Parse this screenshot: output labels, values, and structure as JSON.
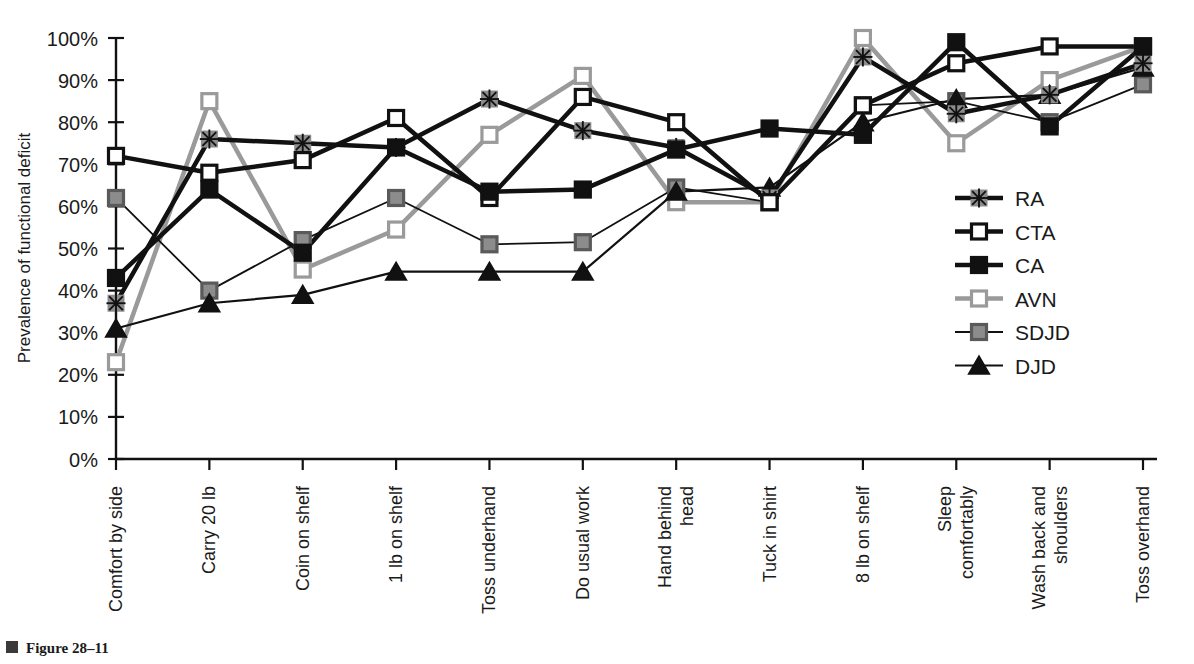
{
  "figure": {
    "caption_label": "Figure 28–11",
    "caption_marker_color": "#3a3a3a"
  },
  "chart_data": {
    "type": "line",
    "title": "",
    "xlabel": "",
    "ylabel": "Prevalence of functional deficit",
    "ylim": [
      0,
      100
    ],
    "ytick_labels": [
      "0%",
      "10%",
      "20%",
      "30%",
      "40%",
      "50%",
      "60%",
      "70%",
      "80%",
      "90%",
      "100%"
    ],
    "ytick_values": [
      0,
      10,
      20,
      30,
      40,
      50,
      60,
      70,
      80,
      90,
      100
    ],
    "grid": false,
    "legend_position": "right-middle",
    "categories": [
      "Comfort by side",
      "Carry 20 lb",
      "Coin on shelf",
      "1 lb on shelf",
      "Toss underhand",
      "Do usual work",
      "Hand behind head",
      "Tuck in shirt",
      "8 lb on shelf",
      "Sleep comfortably",
      "Wash back and shoulders",
      "Toss overhand"
    ],
    "series": [
      {
        "name": "RA",
        "marker": "asterisk",
        "marker_fill": "#8c8c8c",
        "line_color": "#111111",
        "line_width": 4.5,
        "values": [
          37,
          76,
          75,
          74,
          85.5,
          78,
          74,
          62,
          95.5,
          82,
          86.5,
          94
        ]
      },
      {
        "name": "CTA",
        "marker": "square",
        "marker_fill": "#ffffff",
        "marker_stroke": "#111111",
        "line_color": "#111111",
        "line_width": 4.5,
        "values": [
          72,
          68,
          71,
          81,
          62,
          86,
          80,
          61,
          84,
          94,
          98,
          98
        ]
      },
      {
        "name": "CA",
        "marker": "square",
        "marker_fill": "#111111",
        "marker_stroke": "#111111",
        "line_color": "#111111",
        "line_width": 4.5,
        "values": [
          43,
          64,
          49,
          74,
          63.5,
          64,
          73.5,
          78.5,
          77,
          99,
          79,
          98
        ]
      },
      {
        "name": "AVN",
        "marker": "square",
        "marker_fill": "#ffffff",
        "marker_stroke": "#9a9a9a",
        "line_color": "#9a9a9a",
        "line_width": 4.5,
        "values": [
          23,
          85,
          45,
          54.5,
          77,
          91,
          61,
          61,
          100,
          75,
          90,
          98
        ]
      },
      {
        "name": "SDJD",
        "marker": "square",
        "marker_fill": "#8c8c8c",
        "marker_stroke": "#5a5a5a",
        "line_color": "#111111",
        "line_width": 1.8,
        "values": [
          62,
          40,
          52,
          62,
          51,
          51.5,
          64.5,
          61,
          84,
          85,
          80,
          89
        ]
      },
      {
        "name": "DJD",
        "marker": "triangle",
        "marker_fill": "#111111",
        "marker_stroke": "#111111",
        "line_color": "#111111",
        "line_width": 2.2,
        "values": [
          31,
          37,
          39,
          44.5,
          44.5,
          44.5,
          63.5,
          64.5,
          80,
          85.5,
          86.5,
          93
        ]
      }
    ]
  }
}
